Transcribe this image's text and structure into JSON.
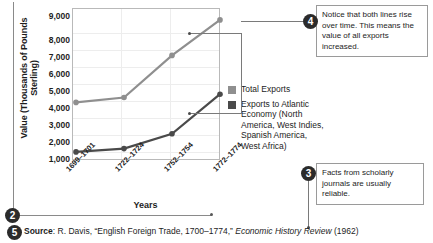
{
  "chart_data": {
    "type": "line",
    "title": "",
    "xlabel": "Years",
    "ylabel": "Value (Thousands of Pounds Sterling)",
    "categories": [
      "1699–1701",
      "1722–1724",
      "1752–1754",
      "1772–1774"
    ],
    "ylim": [
      0,
      9000
    ],
    "yticks": [
      "1,000",
      "2,000",
      "3,000",
      "4,000",
      "5,000",
      "6,000",
      "7,000",
      "8,000",
      "9,000"
    ],
    "ytick_values": [
      1000,
      2000,
      3000,
      4000,
      5000,
      6000,
      7000,
      8000,
      9000
    ],
    "grid": true,
    "legend_position": "right",
    "series": [
      {
        "name": "Total Exports",
        "color": "#8f8f8f",
        "values": [
          3550,
          3850,
          6400,
          8550
        ]
      },
      {
        "name": "Exports to Atlantic Economy (North America, West Indies, Spanish America, West Africa)",
        "color": "#4a4a4a",
        "values": [
          550,
          750,
          1650,
          4050
        ]
      }
    ]
  },
  "legend": {
    "items": [
      {
        "label": "Total Exports",
        "color": "#8f8f8f"
      },
      {
        "label": "Exports to Atlantic Economy (North America, West Indies, Spanish America, West Africa)",
        "color": "#4a4a4a"
      }
    ]
  },
  "annotations": {
    "note4": {
      "number": "4",
      "text": "Notice that both lines rise over time. This means the value of all exports increased."
    },
    "note3": {
      "number": "3",
      "text": "Facts from scholarly journals are usually reliable."
    },
    "callout2": {
      "number": "2"
    },
    "callout5": {
      "number": "5"
    }
  },
  "source": {
    "label": "Source",
    "colon": ": ",
    "author": "R. Davis, ",
    "article": "“English Foreign Trade, 1700–1774,” ",
    "journal": "Economic History Review",
    "year": " (1962)"
  }
}
